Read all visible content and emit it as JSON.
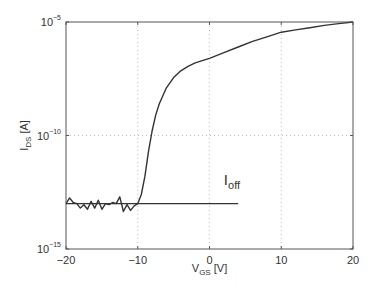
{
  "chart_data": {
    "type": "line",
    "title": "",
    "xlabel": {
      "main": "V",
      "sub": "GS",
      "unit": " [V]"
    },
    "ylabel": {
      "main": "I",
      "sub": "DS",
      "unit": " [A]"
    },
    "xlim": [
      -20,
      20
    ],
    "ylim_log10": [
      -15,
      -5
    ],
    "yscale": "log",
    "grid": true,
    "x_ticks": [
      -20,
      -10,
      0,
      10,
      20
    ],
    "x_tick_labels": [
      "−20",
      "−10",
      "0",
      "10",
      "20"
    ],
    "y_ticks_log10": [
      -15,
      -10,
      -5
    ],
    "y_tick_labels": [
      {
        "base": "10",
        "exp": "−15"
      },
      {
        "base": "10",
        "exp": "−10"
      },
      {
        "base": "10",
        "exp": "−5"
      }
    ],
    "series": [
      {
        "name": "I_DS",
        "x": [
          -20,
          -19.5,
          -19,
          -18.5,
          -18,
          -17.5,
          -17,
          -16.5,
          -16,
          -15.5,
          -15,
          -14.5,
          -14,
          -13.5,
          -13,
          -12.5,
          -12,
          -11.5,
          -11,
          -10.5,
          -10,
          -9.5,
          -9,
          -8.5,
          -8,
          -7.5,
          -7,
          -6,
          -5,
          -4,
          -3,
          -2,
          -1,
          0,
          2,
          4,
          6,
          8,
          10,
          12,
          14,
          16,
          18,
          20
        ],
        "y_log10": [
          -13.0,
          -12.75,
          -12.95,
          -13.0,
          -13.2,
          -13.05,
          -13.25,
          -12.9,
          -13.2,
          -12.85,
          -13.25,
          -13.0,
          -13.05,
          -12.95,
          -13.0,
          -12.7,
          -13.35,
          -13.05,
          -13.3,
          -13.1,
          -13.0,
          -12.6,
          -11.8,
          -10.7,
          -9.8,
          -9.1,
          -8.6,
          -7.9,
          -7.45,
          -7.15,
          -6.95,
          -6.8,
          -6.7,
          -6.6,
          -6.35,
          -6.1,
          -5.85,
          -5.65,
          -5.45,
          -5.35,
          -5.25,
          -5.15,
          -5.07,
          -5.0
        ]
      },
      {
        "name": "I_off",
        "x": [
          -20,
          4
        ],
        "y_log10": [
          -13.0,
          -13.0
        ]
      }
    ],
    "annotations": [
      {
        "text_main": "I",
        "text_sub": "off",
        "x": 2,
        "y_log10": -12.2
      }
    ]
  }
}
